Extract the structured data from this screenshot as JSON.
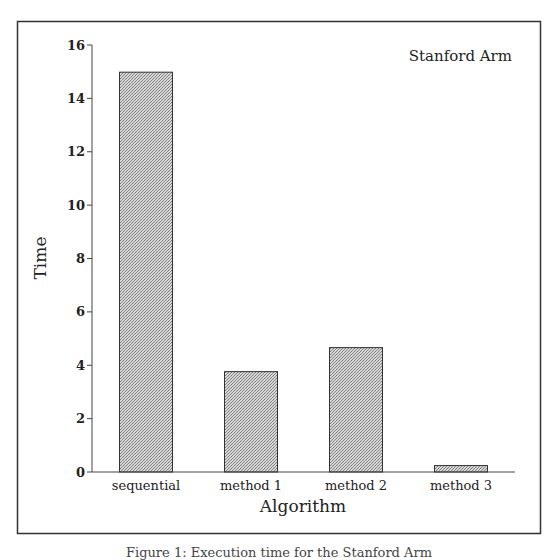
{
  "chart_data": {
    "type": "bar",
    "title": "",
    "annotation": "Stanford Arm",
    "xlabel": "Algorithm",
    "ylabel": "Time",
    "categories": [
      "sequential",
      "method 1",
      "method 2",
      "method 3"
    ],
    "values": [
      15.0,
      3.78,
      4.68,
      0.26
    ],
    "ylim": [
      0,
      16
    ],
    "yticks": [
      0,
      2,
      4,
      6,
      8,
      10,
      12,
      14,
      16
    ],
    "grid": false,
    "legend": null,
    "bar_fill": "#b9b9b9",
    "bar_edge": "#333333"
  },
  "caption": "Figure 1: Execution time for the Stanford Arm"
}
